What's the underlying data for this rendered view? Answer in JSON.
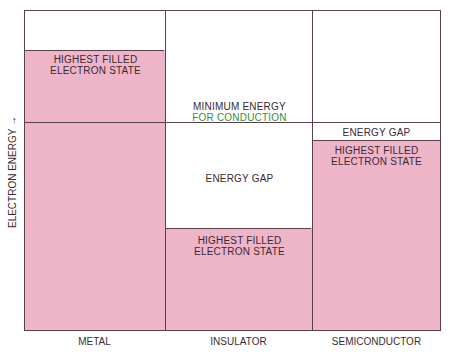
{
  "diagram": {
    "y_axis_label": "ELECTRON ENERGY →",
    "colors": {
      "filled": "#eeb4c8",
      "line": "#5a4048",
      "green_text": "#3b8a3b"
    },
    "columns": [
      {
        "name": "METAL",
        "labels": {
          "filled": "HIGHEST FILLED\nELECTRON STATE"
        }
      },
      {
        "name": "INSULATOR",
        "labels": {
          "min_energy_line1": "MINIMUM ENERGY",
          "min_energy_line2": "FOR CONDUCTION",
          "gap": "ENERGY GAP",
          "filled_line1": "HIGHEST FILLED",
          "filled_line2": "ELECTRON STATE"
        }
      },
      {
        "name": "SEMICONDUCTOR",
        "labels": {
          "gap": "ENERGY GAP",
          "filled_line1": "HIGHEST FILLED",
          "filled_line2": "ELECTRON STATE"
        }
      }
    ],
    "metal_labels": {
      "line1": "HIGHEST FILLED",
      "line2": "ELECTRON STATE"
    }
  }
}
